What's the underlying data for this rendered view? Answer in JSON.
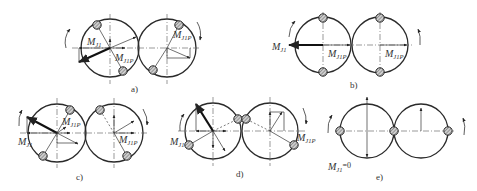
{
  "figure": {
    "panels": [
      {
        "id": "a",
        "caption": "a)",
        "labels": {
          "mj1": "M",
          "mj1_sub": "J1",
          "mj1p": "M",
          "mj1p_sub": "J1P",
          "mj1p_right": "M",
          "mj1p_right_sub": "J1P"
        }
      },
      {
        "id": "b",
        "caption": "b)",
        "labels": {
          "mj1": "M",
          "mj1_sub": "J1",
          "mj1p": "M",
          "mj1p_sub": "J1P",
          "mj1p_right": "M",
          "mj1p_right_sub": "J1P"
        }
      },
      {
        "id": "c",
        "caption": "c)",
        "labels": {
          "mj1": "M",
          "mj1_sub": "J1",
          "mj1p": "M",
          "mj1p_sub": "J1P",
          "mj1p_right": "M",
          "mj1p_right_sub": "J1P"
        }
      },
      {
        "id": "d",
        "caption": "d)",
        "labels": {
          "mj1": "M",
          "mj1_sub": "J1",
          "mj1p_right": "M",
          "mj1p_right_sub": "J1P"
        }
      },
      {
        "id": "e",
        "caption": "e)",
        "labels": {
          "mj1": "M",
          "mj1_sub": "J1",
          "mj1_eq": "=0"
        }
      }
    ]
  }
}
